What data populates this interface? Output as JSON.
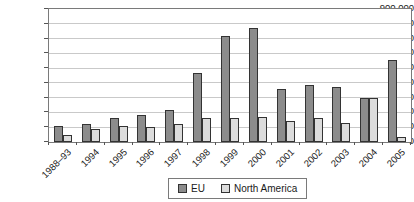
{
  "chart_data": {
    "type": "bar",
    "title": "",
    "xlabel": "",
    "ylabel": "",
    "categories": [
      "1988–93",
      "1994",
      "1995",
      "1996",
      "1997",
      "1998",
      "1999",
      "2000",
      "2001",
      "2002",
      "2003",
      "2004",
      "2005"
    ],
    "series": [
      {
        "name": "EU",
        "color": "#8c8c8c",
        "values": [
          110000,
          125000,
          160000,
          180000,
          215000,
          465000,
          720000,
          770000,
          360000,
          385000,
          375000,
          300000,
          555000
        ]
      },
      {
        "name": "North America",
        "color": "#dcdcdc",
        "values": [
          45000,
          85000,
          105000,
          100000,
          120000,
          165000,
          160000,
          170000,
          145000,
          160000,
          130000,
          300000,
          35000
        ]
      }
    ],
    "ylim": [
      0,
      900000
    ],
    "ytick_step": 100000,
    "yticks": [
      {
        "v": 0,
        "label": "0"
      },
      {
        "v": 100000,
        "label": "100,000"
      },
      {
        "v": 200000,
        "label": "200,000"
      },
      {
        "v": 300000,
        "label": "300,000"
      },
      {
        "v": 400000,
        "label": "400,000"
      },
      {
        "v": 500000,
        "label": "500,000"
      },
      {
        "v": 600000,
        "label": "600,000"
      },
      {
        "v": 700000,
        "label": "700,000"
      },
      {
        "v": 800000,
        "label": "800,000"
      },
      {
        "v": 900000,
        "label": "900,000"
      }
    ],
    "grid": true,
    "legend_position": "bottom-center"
  },
  "colors": {
    "eu_fill": "#8c8c8c",
    "na_fill": "#dcdcdc",
    "bar_outline": "#333333",
    "gridline": "#c9c9c9",
    "plot_border": "#7a7a7a",
    "background": "#ffffff",
    "text": "#1a1a1a"
  }
}
